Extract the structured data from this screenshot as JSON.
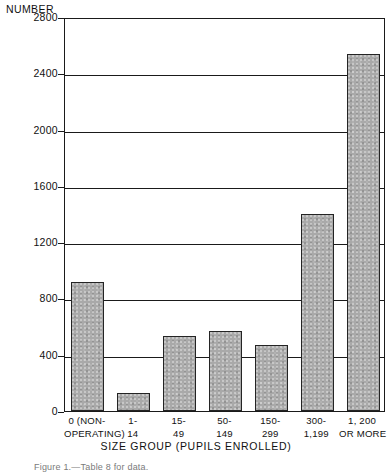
{
  "chart_data": {
    "type": "bar",
    "title": "",
    "ylabel": "NUMBER",
    "xlabel": "SIZE GROUP (PUPILS ENROLLED)",
    "categories": [
      "0 (NON-OPERATING)",
      "1-14",
      "15-49",
      "50-149",
      "150-299",
      "300-1,199",
      "1,200 OR MORE"
    ],
    "category_lines": [
      {
        "line1": "0 (NON-",
        "line2": "OPERATING)"
      },
      {
        "line1": "1-",
        "line2": "14"
      },
      {
        "line1": "15-",
        "line2": "49"
      },
      {
        "line1": "50-",
        "line2": "149"
      },
      {
        "line1": "150-",
        "line2": "299"
      },
      {
        "line1": "300-",
        "line2": "1,199"
      },
      {
        "line1": "1, 200",
        "line2": "OR  MORE"
      }
    ],
    "values": [
      920,
      130,
      530,
      570,
      470,
      1400,
      2540
    ],
    "ylim": [
      0,
      2800
    ],
    "ytick_labels": [
      "2800",
      "2400",
      "2000",
      "1600",
      "1200",
      "800",
      "400",
      "0"
    ],
    "ytick_values": [
      2800,
      2400,
      2000,
      1600,
      1200,
      800,
      400,
      0
    ],
    "grid": true,
    "legend": "none",
    "bar_color": "#a9a9a9",
    "bar_edge_color": "#242424",
    "axis_color": "#1a1a1a"
  },
  "caption": "Figure 1.—Table 8 for data."
}
